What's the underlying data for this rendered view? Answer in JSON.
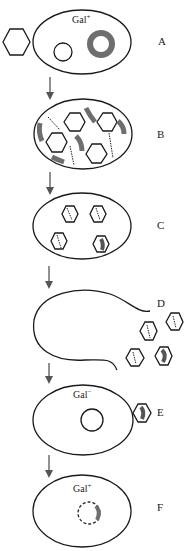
{
  "diagram": {
    "type": "process-flow",
    "stages": [
      {
        "id": "A",
        "label": "A",
        "cell_label": "Gal",
        "cell_superscript": "+",
        "contents": [
          "phage",
          "prophage circle",
          "gal plasmid ring"
        ]
      },
      {
        "id": "B",
        "label": "B",
        "contents": [
          "phage heads",
          "DNA segments",
          "gal fragments"
        ]
      },
      {
        "id": "C",
        "label": "C",
        "contents": [
          "packaged phages",
          "one with gal fragment"
        ]
      },
      {
        "id": "D",
        "label": "D",
        "contents": [
          "lysed cell",
          "released phages"
        ]
      },
      {
        "id": "E",
        "label": "E",
        "cell_label": "Gal",
        "cell_superscript": "−",
        "contents": [
          "recipient cell",
          "phage with gal"
        ]
      },
      {
        "id": "F",
        "label": "F",
        "cell_label": "Gal",
        "cell_superscript": "+",
        "contents": [
          "transduced cell",
          "integrated gal"
        ]
      }
    ]
  }
}
